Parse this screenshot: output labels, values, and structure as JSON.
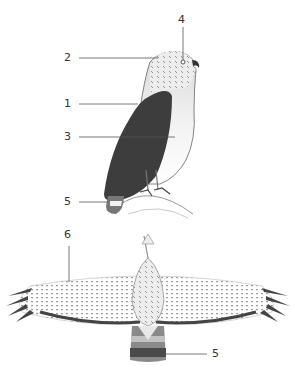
{
  "figure": {
    "views": [
      "perched side view",
      "flight view from above"
    ],
    "callouts": [
      {
        "id": "c4",
        "label": "4",
        "target": "eye"
      },
      {
        "id": "c2",
        "label": "2",
        "target": "crown / head"
      },
      {
        "id": "c1",
        "label": "1",
        "target": "folded wing / back"
      },
      {
        "id": "c3",
        "label": "3",
        "target": "breast / underparts"
      },
      {
        "id": "c5a",
        "label": "5",
        "target": "tail (perched)"
      },
      {
        "id": "c6",
        "label": "6",
        "target": "wing (flight)"
      },
      {
        "id": "c5b",
        "label": "5",
        "target": "tail bands (flight)"
      }
    ],
    "colors": {
      "wing_dark": "#3d3d3d",
      "line": "#555555",
      "feather_light": "#e6e6e6",
      "tail_band_dark": "#4a4a4a",
      "tail_band_mid": "#8a8a8a"
    }
  }
}
